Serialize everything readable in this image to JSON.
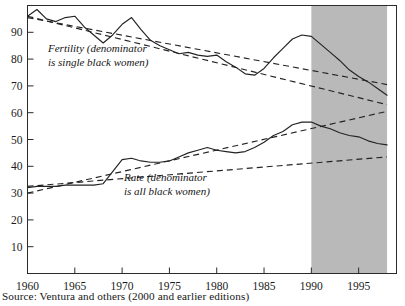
{
  "figure": {
    "source_note": "Source: Ventura and others (2000 and earlier editions)"
  },
  "annotations": {
    "fertility_line1": "Fertility (denominator",
    "fertility_line2": "is single black women)",
    "rate_line1": "Rate (denominator",
    "rate_line2": "is all black women)"
  },
  "colors": {
    "ink": "#232323",
    "shade_band": "#b9b9b9",
    "background": "#ffffff"
  },
  "chart_data": {
    "type": "line",
    "title": "",
    "xlabel": "",
    "ylabel": "",
    "xlim": [
      1960,
      1999
    ],
    "ylim": [
      0,
      100
    ],
    "grid": false,
    "legend": "none",
    "xticks": [
      1960,
      1965,
      1970,
      1975,
      1980,
      1985,
      1990,
      1995
    ],
    "xtick_labels": [
      "1960",
      "1965",
      "1970",
      "1975",
      "1980",
      "1985",
      "1990",
      "1995"
    ],
    "yticks": [
      10,
      20,
      30,
      40,
      50,
      60,
      70,
      80,
      90
    ],
    "ytick_labels": [
      "10",
      "20",
      "30",
      "40",
      "50",
      "60",
      "70",
      "80",
      "90"
    ],
    "shaded_region": {
      "x_start": 1990,
      "x_end": 1998,
      "color": "#b9b9b9"
    },
    "series": [
      {
        "name": "Fertility (denominator is single black women)",
        "style": "solid",
        "x": [
          1960,
          1961,
          1962,
          1963,
          1964,
          1965,
          1966,
          1967,
          1968,
          1969,
          1970,
          1971,
          1972,
          1973,
          1974,
          1975,
          1976,
          1977,
          1978,
          1979,
          1980,
          1981,
          1982,
          1983,
          1984,
          1985,
          1986,
          1987,
          1988,
          1989,
          1990,
          1991,
          1992,
          1993,
          1994,
          1995,
          1996,
          1997,
          1998
        ],
        "values": [
          96.0,
          98.5,
          95.0,
          94.0,
          95.5,
          96.0,
          92.0,
          89.0,
          86.0,
          89.0,
          93.0,
          95.5,
          91.0,
          87.0,
          85.0,
          83.5,
          82.0,
          82.5,
          81.5,
          81.0,
          81.5,
          79.0,
          77.0,
          74.5,
          74.0,
          76.5,
          80.5,
          84.0,
          87.5,
          89.0,
          88.5,
          85.5,
          82.5,
          79.5,
          76.0,
          73.5,
          71.5,
          69.0,
          66.5
        ]
      },
      {
        "name": "Fertility trend (linear)",
        "style": "dashed",
        "x": [
          1960,
          1998
        ],
        "values": [
          95.5,
          70.5
        ]
      },
      {
        "name": "Fertility trend (revised)",
        "style": "dashed",
        "x": [
          1960,
          1998
        ],
        "values": [
          96.0,
          63.0
        ]
      },
      {
        "name": "Rate (denominator is all black women)",
        "style": "solid",
        "x": [
          1960,
          1961,
          1962,
          1963,
          1964,
          1965,
          1966,
          1967,
          1968,
          1969,
          1970,
          1971,
          1972,
          1973,
          1974,
          1975,
          1976,
          1977,
          1978,
          1979,
          1980,
          1981,
          1982,
          1983,
          1984,
          1985,
          1986,
          1987,
          1988,
          1989,
          1990,
          1991,
          1992,
          1993,
          1994,
          1995,
          1996,
          1997,
          1998
        ],
        "values": [
          32.0,
          32.5,
          32.5,
          32.5,
          33.0,
          33.0,
          33.0,
          33.0,
          33.5,
          38.0,
          42.5,
          43.0,
          42.0,
          41.5,
          41.5,
          42.0,
          43.5,
          45.0,
          46.0,
          47.0,
          46.0,
          45.5,
          45.0,
          45.5,
          47.0,
          49.0,
          51.5,
          53.0,
          55.5,
          56.5,
          56.5,
          55.0,
          54.0,
          52.5,
          51.5,
          51.0,
          49.5,
          48.5,
          48.0
        ]
      },
      {
        "name": "Rate trend (linear)",
        "style": "dashed",
        "x": [
          1960,
          1998
        ],
        "values": [
          30.0,
          60.5
        ]
      },
      {
        "name": "Rate trend (revised)",
        "style": "dashed",
        "x": [
          1960,
          1998
        ],
        "values": [
          32.5,
          43.5
        ]
      }
    ]
  }
}
